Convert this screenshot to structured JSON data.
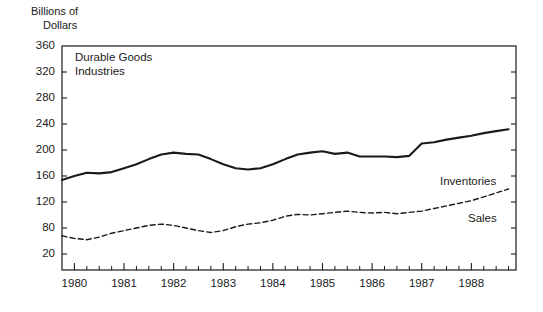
{
  "axis_unit": {
    "line1": "Billions of",
    "line2": "Dollars"
  },
  "annotation": {
    "line1": "Durable Goods",
    "line2": "Industries"
  },
  "series_labels": {
    "inventories": "Inventories",
    "sales": "Sales"
  },
  "chart_data": {
    "type": "line",
    "title": "",
    "subtitle": "",
    "annotations": [
      "Durable Goods Industries"
    ],
    "xlabel": "",
    "ylabel": "Billions of Dollars",
    "ylim": [
      0,
      360
    ],
    "xlim": [
      1979.75,
      1988.9
    ],
    "grid": false,
    "legend_position": "inline-right",
    "ytick_labels": [
      "360",
      "320",
      "280",
      "240",
      "200",
      "160",
      "120",
      "80",
      "20"
    ],
    "ytick_values": [
      360,
      320,
      280,
      240,
      200,
      160,
      120,
      80,
      40
    ],
    "xtick_labels": [
      "1980",
      "1981",
      "1982",
      "1983",
      "1984",
      "1985",
      "1986",
      "1987",
      "1988"
    ],
    "xtick_values": [
      1980,
      1981,
      1982,
      1983,
      1984,
      1985,
      1986,
      1987,
      1988
    ],
    "minor_ticks_per_interval": 3,
    "x": [
      1979.75,
      1980.0,
      1980.25,
      1980.5,
      1980.75,
      1981.0,
      1981.25,
      1981.5,
      1981.75,
      1982.0,
      1982.25,
      1982.5,
      1982.75,
      1983.0,
      1983.25,
      1983.5,
      1983.75,
      1984.0,
      1984.25,
      1984.5,
      1984.75,
      1985.0,
      1985.25,
      1985.5,
      1985.75,
      1986.0,
      1986.25,
      1986.5,
      1986.75,
      1987.0,
      1987.25,
      1987.5,
      1987.75,
      1988.0,
      1988.25,
      1988.5,
      1988.75
    ],
    "series": [
      {
        "name": "Inventories",
        "style": "solid",
        "color": "#1a1a1a",
        "values": [
          154,
          160,
          165,
          164,
          166,
          172,
          178,
          186,
          193,
          196,
          194,
          193,
          186,
          178,
          172,
          170,
          172,
          178,
          186,
          193,
          196,
          198,
          194,
          196,
          190,
          190,
          190,
          189,
          191,
          210,
          212,
          216,
          219,
          222,
          226,
          229,
          232
        ]
      },
      {
        "name": "Sales",
        "style": "dashed",
        "color": "#1a1a1a",
        "values": [
          68,
          64,
          62,
          66,
          72,
          76,
          80,
          84,
          86,
          84,
          80,
          76,
          73,
          76,
          82,
          86,
          88,
          92,
          98,
          101,
          100,
          102,
          104,
          106,
          104,
          103,
          104,
          102,
          104,
          106,
          110,
          114,
          118,
          122,
          128,
          134,
          140
        ]
      }
    ]
  },
  "colors": {
    "axis": "#1a1a1a",
    "text": "#1a1a1a",
    "background": "#ffffff"
  },
  "geometry": {
    "plot_left": 62,
    "plot_right": 516,
    "plot_top": 46,
    "plot_bottom": 270,
    "y_top_value": 360,
    "y_step_px": 26,
    "y_step_value": 40,
    "x_left_value": 1979.75,
    "x_right_value": 1988.9
  }
}
